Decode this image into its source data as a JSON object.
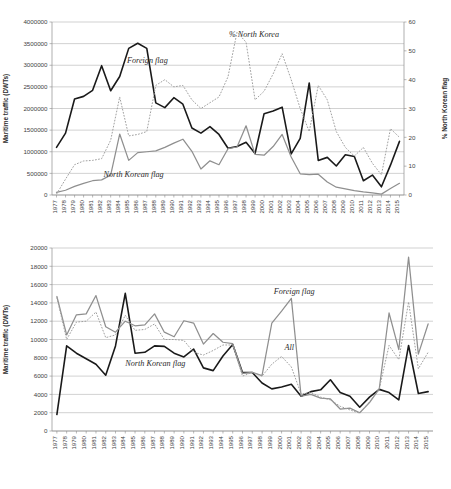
{
  "figure": {
    "title": "",
    "charts": 2
  },
  "chart_data": [
    {
      "id": "top",
      "type": "line",
      "title": "",
      "xlabel": "",
      "ylabel": "Maritime traffic (DWTs)",
      "ylabel_secondary": "% North Korean flag",
      "ylim": [
        0,
        4000000
      ],
      "yticks": [
        0,
        500000,
        1000000,
        1500000,
        2000000,
        2500000,
        3000000,
        3500000,
        4000000
      ],
      "ylim_secondary": [
        0,
        60
      ],
      "yticks_secondary": [
        0,
        10,
        20,
        30,
        40,
        50,
        60
      ],
      "grid": true,
      "legend_position": "inline-annotations",
      "x": [
        1977,
        1978,
        1979,
        1980,
        1981,
        1982,
        1983,
        1984,
        1985,
        1986,
        1987,
        1988,
        1989,
        1990,
        1991,
        1992,
        1993,
        1994,
        1995,
        1996,
        1997,
        1998,
        1999,
        2000,
        2001,
        2002,
        2003,
        2004,
        2005,
        2006,
        2007,
        2008,
        2009,
        2010,
        2011,
        2012,
        2013,
        2014,
        2015
      ],
      "categories": [
        "1977",
        "1978",
        "1979",
        "1980",
        "1981",
        "1982",
        "1983",
        "1984",
        "1985",
        "1986",
        "1987",
        "1988",
        "1989",
        "1990",
        "1991",
        "1992",
        "1993",
        "1994",
        "1995",
        "1996",
        "1997",
        "1998",
        "1999",
        "2000",
        "2001",
        "2002",
        "2003",
        "2004",
        "2005",
        "2006",
        "2007",
        "2008",
        "2009",
        "2010",
        "2011",
        "2012",
        "2013",
        "2014",
        "2015"
      ],
      "series": [
        {
          "name": "Foreign flag",
          "axis": "left",
          "style": "solid-black",
          "color": "#1a1a1a",
          "values": [
            1100000,
            1430000,
            2220000,
            2280000,
            2420000,
            2990000,
            2410000,
            2740000,
            3390000,
            3510000,
            3390000,
            2130000,
            2020000,
            2250000,
            2100000,
            1550000,
            1430000,
            1580000,
            1400000,
            1080000,
            1120000,
            1220000,
            960000,
            1880000,
            1940000,
            2030000,
            950000,
            1310000,
            2590000,
            800000,
            870000,
            670000,
            930000,
            890000,
            330000,
            460000,
            190000,
            690000,
            1240000
          ]
        },
        {
          "name": "North Korean flag",
          "axis": "left",
          "style": "solid-gray",
          "color": "#8f8f8f",
          "values": [
            60000,
            110000,
            200000,
            270000,
            330000,
            350000,
            460000,
            1410000,
            800000,
            980000,
            1000000,
            1020000,
            1100000,
            1200000,
            1290000,
            1010000,
            600000,
            790000,
            700000,
            1070000,
            1110000,
            1600000,
            940000,
            920000,
            1120000,
            1400000,
            880000,
            490000,
            470000,
            480000,
            300000,
            180000,
            140000,
            100000,
            70000,
            50000,
            20000,
            150000,
            270000
          ]
        },
        {
          "name": "% North Korea",
          "axis": "right",
          "style": "dotted-gray",
          "color": "#a0a0a0",
          "values": [
            0.3,
            5.5,
            10.5,
            11.8,
            12.0,
            12.6,
            19.0,
            34.0,
            20.5,
            21.0,
            22.0,
            38.0,
            40.0,
            37.5,
            38.0,
            33.0,
            30.0,
            32.0,
            34.0,
            41.0,
            56.5,
            53.0,
            33.0,
            36.0,
            42.0,
            49.0,
            40.0,
            30.0,
            22.0,
            38.0,
            33.0,
            22.0,
            16.5,
            13.5,
            16.5,
            11.0,
            7.0,
            23.0,
            20.0
          ]
        }
      ],
      "annotations": [
        {
          "text": "Foreign flag",
          "x": 1984.8,
          "y": 3060000,
          "axis": "left"
        },
        {
          "text": "% North Korea",
          "x": 1996.1,
          "y": 3660000,
          "axis": "left"
        },
        {
          "text": "North Korean flag",
          "x": 1982.2,
          "y": 420000,
          "axis": "left"
        }
      ]
    },
    {
      "id": "bottom",
      "type": "line",
      "title": "",
      "xlabel": "",
      "ylabel": "Maritime traffic (DWTs)",
      "ylim": [
        0,
        20000
      ],
      "yticks": [
        0,
        2000,
        4000,
        6000,
        8000,
        10000,
        12000,
        14000,
        16000,
        18000,
        20000
      ],
      "grid": true,
      "legend_position": "inline-annotations",
      "x": [
        1977,
        1978,
        1979,
        1980,
        1981,
        1982,
        1983,
        1984,
        1985,
        1986,
        1987,
        1988,
        1989,
        1990,
        1991,
        1992,
        1993,
        1994,
        1995,
        1996,
        1997,
        1998,
        1999,
        2000,
        2001,
        2002,
        2003,
        2004,
        2005,
        2006,
        2007,
        2008,
        2009,
        2010,
        2011,
        2012,
        2013,
        2014,
        2015
      ],
      "categories": [
        "1977",
        "1978",
        "1979",
        "1980",
        "1981",
        "1982",
        "1983",
        "1984",
        "1985",
        "1986",
        "1987",
        "1988",
        "1989",
        "1990",
        "1991",
        "1992",
        "1993",
        "1994",
        "1995",
        "1996",
        "1997",
        "1998",
        "1999",
        "2000",
        "2001",
        "2002",
        "2003",
        "2004",
        "2005",
        "2006",
        "2007",
        "2008",
        "2009",
        "2010",
        "2011",
        "2012",
        "2013",
        "2014",
        "2015"
      ],
      "series": [
        {
          "name": "North Korean flag",
          "axis": "left",
          "style": "solid-black",
          "color": "#1a1a1a",
          "values": [
            1800,
            9300,
            8500,
            7900,
            7300,
            6100,
            9300,
            15050,
            8500,
            8600,
            9300,
            9250,
            8500,
            8100,
            8950,
            6900,
            6600,
            8200,
            9450,
            6400,
            6400,
            5250,
            4600,
            4800,
            5100,
            3800,
            4300,
            4500,
            5600,
            4200,
            3800,
            2600,
            3700,
            4550,
            4200,
            3400,
            9350,
            4100,
            4300
          ]
        },
        {
          "name": "Foreign flag",
          "axis": "left",
          "style": "solid-gray",
          "color": "#8f8f8f",
          "values": [
            14700,
            10500,
            12700,
            12800,
            14800,
            11400,
            10800,
            12000,
            11500,
            11600,
            12800,
            10800,
            10300,
            12050,
            11800,
            9500,
            10650,
            9700,
            9550,
            6300,
            6400,
            6050,
            11800,
            13100,
            14500,
            3800,
            4000,
            3600,
            3500,
            2400,
            2500,
            2000,
            3100,
            4600,
            12900,
            8900,
            19000,
            8400,
            11700
          ]
        },
        {
          "name": "All",
          "axis": "left",
          "style": "dotted-gray",
          "color": "#a0a0a0",
          "values": [
            14600,
            10000,
            11900,
            12000,
            13000,
            10200,
            10500,
            12650,
            11000,
            11100,
            11700,
            10000,
            10000,
            9900,
            8600,
            8300,
            8800,
            9400,
            9400,
            6000,
            6400,
            6000,
            7300,
            8150,
            7000,
            4050,
            4200,
            3700,
            3400,
            2700,
            2300,
            1950,
            3200,
            4600,
            9350,
            7800,
            14100,
            6800,
            8600
          ]
        }
      ],
      "annotations": [
        {
          "text": "Foreign flag",
          "x": 1999.2,
          "y": 15000,
          "axis": "left"
        },
        {
          "text": "All",
          "x": 2000.3,
          "y": 8900,
          "axis": "left"
        },
        {
          "text": "North Korean flag",
          "x": 1984.0,
          "y": 7150,
          "axis": "left"
        }
      ]
    }
  ]
}
